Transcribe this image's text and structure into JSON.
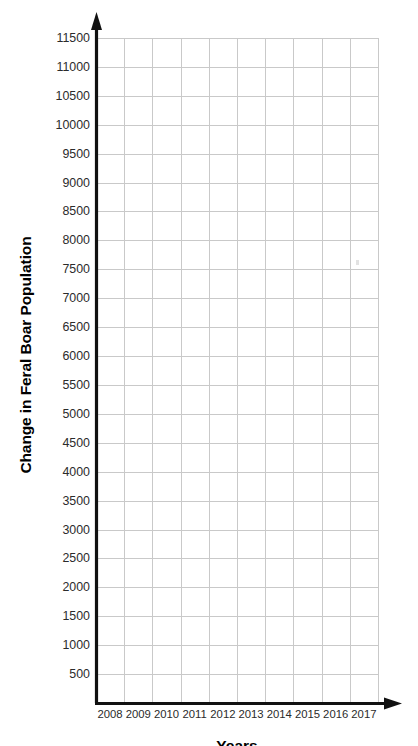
{
  "chart_data": {
    "type": "line",
    "title": "",
    "subtitle": "",
    "xlabel": "Years",
    "ylabel": "Change in Feral Boar Population",
    "grid": true,
    "legend": null,
    "series": [],
    "values": [],
    "note": "Blank plotting grid — axes and gridlines only, no plotted data points",
    "x": {
      "categories": [
        "2008",
        "2009",
        "2010",
        "2011",
        "2012",
        "2013",
        "2014",
        "2015",
        "2016",
        "2017"
      ],
      "tick_labels": [
        "2008",
        "2009",
        "2010",
        "2011",
        "2012",
        "2013",
        "2014",
        "2015",
        "2016",
        "2017"
      ],
      "count": 10,
      "first": 2008,
      "last": 2017,
      "step": 1,
      "axis_arrow": "right"
    },
    "y": {
      "tick_labels": [
        "11500",
        "11000",
        "10500",
        "10000",
        "9500",
        "9000",
        "8500",
        "8000",
        "7500",
        "7000",
        "6500",
        "6000",
        "5500",
        "5000",
        "4500",
        "4000",
        "3500",
        "3000",
        "2500",
        "2000",
        "1500",
        "1000",
        "500"
      ],
      "tick_values": [
        11500,
        11000,
        10500,
        10000,
        9500,
        9000,
        8500,
        8000,
        7500,
        7000,
        6500,
        6000,
        5500,
        5000,
        4500,
        4000,
        3500,
        3000,
        2500,
        2000,
        1500,
        1000,
        500
      ],
      "ylim": [
        0,
        11500
      ],
      "step": 500,
      "count": 23,
      "axis_arrow": "up"
    },
    "colors": {
      "background": "#ffffff",
      "gridline": "#c9c9c9",
      "axis": "#111111",
      "tick_text": "#2b2b2b",
      "title_text": "#000000"
    }
  },
  "axes": {
    "y_title": "Change in Feral Boar Population",
    "x_title": "Years"
  }
}
